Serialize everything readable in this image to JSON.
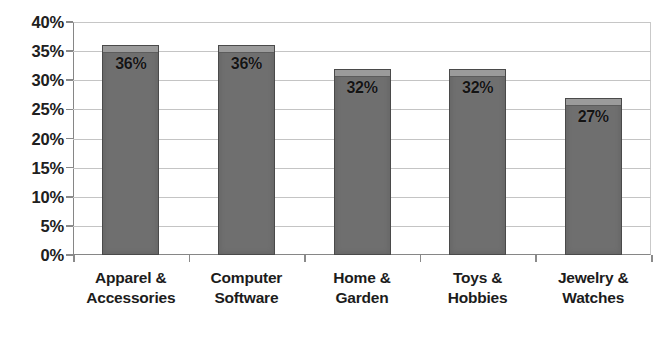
{
  "chart_data": {
    "type": "bar",
    "title": "",
    "subtitle": "",
    "xlabel": "",
    "ylabel": "",
    "categories": [
      "Apparel & Accessories",
      "Computer Software",
      "Home & Garden",
      "Toys & Hobbies",
      "Jewelry & Watches"
    ],
    "category_lines": [
      [
        "Apparel &",
        "Accessories"
      ],
      [
        "Computer",
        "Software"
      ],
      [
        "Home &",
        "Garden"
      ],
      [
        "Toys &",
        "Hobbies"
      ],
      [
        "Jewelry &",
        "Watches"
      ]
    ],
    "values": [
      36,
      36,
      32,
      32,
      27
    ],
    "data_labels": [
      "36%",
      "36%",
      "32%",
      "32%",
      "27%"
    ],
    "ylim": [
      0,
      40
    ],
    "ytick_values": [
      40,
      35,
      30,
      25,
      20,
      15,
      10,
      5,
      0
    ],
    "ytick_labels": [
      "40%",
      "35%",
      "30%",
      "25%",
      "20%",
      "15%",
      "10%",
      "5%",
      "0%"
    ],
    "grid": true,
    "grid_axis": "y",
    "legend": false,
    "legend_position": "none",
    "series": [
      {
        "name": "",
        "values": [
          36,
          36,
          32,
          32,
          27
        ]
      }
    ],
    "colors": {
      "bar_fill": "#6f6f6f",
      "bar_bevel": "#9b9b9b",
      "bar_border": "#4a4a4a",
      "gridline": "#c4c4c4",
      "axis": "#868686",
      "background": "#ffffff",
      "label_text": "#141414",
      "tick_text": "#202020"
    }
  },
  "axis": {
    "y_ticks": [
      {
        "label": "40%",
        "value": 40
      },
      {
        "label": "35%",
        "value": 35
      },
      {
        "label": "30%",
        "value": 30
      },
      {
        "label": "25%",
        "value": 25
      },
      {
        "label": "20%",
        "value": 20
      },
      {
        "label": "15%",
        "value": 15
      },
      {
        "label": "10%",
        "value": 10
      },
      {
        "label": "5%",
        "value": 5
      },
      {
        "label": "0%",
        "value": 0
      }
    ]
  }
}
